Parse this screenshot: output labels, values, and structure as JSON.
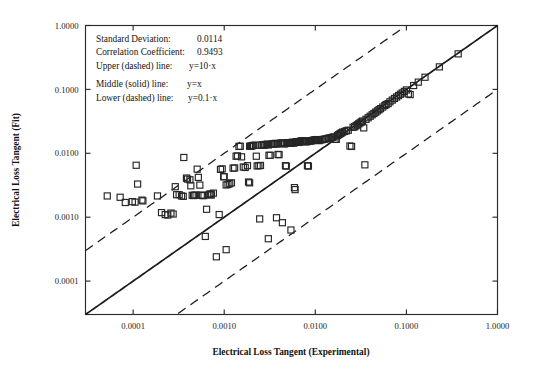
{
  "chart_data": {
    "type": "scatter",
    "title": "",
    "xlabel": "Electrical Loss Tangent (Experimental)",
    "ylabel": "Electrical Loss Tangent (Fit)",
    "xscale": "log",
    "yscale": "log",
    "xlim": [
      3e-05,
      1.0
    ],
    "ylim": [
      3e-05,
      1.0
    ],
    "grid": false,
    "legend": "none",
    "marker": "open-square",
    "xticks": [
      0.0001,
      0.001,
      0.01,
      0.1,
      1.0
    ],
    "xticklabels": [
      "0.0001",
      "0.0010",
      "0.0100",
      "0.1000",
      "1.0000"
    ],
    "yticks": [
      0.0001,
      0.001,
      0.01,
      0.1,
      1.0
    ],
    "yticklabels": [
      "0.0001",
      "0.0010",
      "0.0100",
      "0.1000",
      "1.0000"
    ],
    "annotations": [
      {
        "label": "Standard Deviation:",
        "value": "0.0114"
      },
      {
        "label": "Correlation Coefficient:",
        "value": "0.9493"
      },
      {
        "label": "Upper (dashed) line:",
        "value": "y=10·x"
      },
      {
        "label": "Middle (solid) line:",
        "value": "y=x"
      },
      {
        "label": "Lower (dashed) line:",
        "value": "y=0.1·x"
      }
    ],
    "reference_lines": [
      {
        "name": "upper",
        "style": "dashed",
        "equation": "y=10*x",
        "slope": 1,
        "factor": 10
      },
      {
        "name": "middle",
        "style": "solid",
        "equation": "y=x",
        "slope": 1,
        "factor": 1
      },
      {
        "name": "lower",
        "style": "dashed",
        "equation": "y=0.1*x",
        "slope": 1,
        "factor": 0.1
      }
    ],
    "points": [
      [
        5.2e-05,
        0.00215
      ],
      [
        7.2e-05,
        0.00205
      ],
      [
        8.2e-05,
        0.0017
      ],
      [
        9.8e-05,
        0.00175
      ],
      [
        0.000105,
        0.00172
      ],
      [
        0.000108,
        0.0065
      ],
      [
        0.000112,
        0.0033
      ],
      [
        0.000125,
        0.00185
      ],
      [
        0.000128,
        0.0018
      ],
      [
        0.000185,
        0.00215
      ],
      [
        0.000205,
        0.00118
      ],
      [
        0.000225,
        0.0011
      ],
      [
        0.00024,
        0.00108
      ],
      [
        0.00026,
        0.00116
      ],
      [
        0.000275,
        0.00112
      ],
      [
        0.00029,
        0.003
      ],
      [
        0.0003,
        0.00225
      ],
      [
        0.00032,
        0.00225
      ],
      [
        0.00034,
        0.00215
      ],
      [
        0.000355,
        0.00212
      ],
      [
        0.00036,
        0.0086
      ],
      [
        0.000385,
        0.0041
      ],
      [
        0.000395,
        0.00395
      ],
      [
        0.00042,
        0.00385
      ],
      [
        0.00043,
        0.0031
      ],
      [
        0.000445,
        0.0022
      ],
      [
        0.00046,
        0.00218
      ],
      [
        0.00047,
        0.0022
      ],
      [
        0.00049,
        0.00222
      ],
      [
        0.000505,
        0.00565
      ],
      [
        0.00052,
        0.0042
      ],
      [
        0.00054,
        0.00318
      ],
      [
        0.00056,
        0.00222
      ],
      [
        0.000575,
        0.00218
      ],
      [
        0.0006,
        0.00218
      ],
      [
        0.00062,
        0.0005
      ],
      [
        0.00064,
        0.00133
      ],
      [
        0.00068,
        0.00227
      ],
      [
        0.0007,
        0.0023
      ],
      [
        0.00072,
        0.00222
      ],
      [
        0.00076,
        0.00238
      ],
      [
        0.00082,
        0.00024
      ],
      [
        0.00088,
        0.0011
      ],
      [
        0.00091,
        0.0056
      ],
      [
        0.00095,
        0.0057
      ],
      [
        0.000985,
        0.0043
      ],
      [
        0.001,
        0.0043
      ],
      [
        0.00105,
        0.0032
      ],
      [
        0.0011,
        0.00325
      ],
      [
        0.00115,
        0.00335
      ],
      [
        0.0012,
        0.00345
      ],
      [
        0.00125,
        0.00585
      ],
      [
        0.0013,
        0.0059
      ],
      [
        0.00135,
        0.009
      ],
      [
        0.0014,
        0.0091
      ],
      [
        0.00145,
        0.0128
      ],
      [
        0.0015,
        0.0129
      ],
      [
        0.00155,
        0.0088
      ],
      [
        0.00162,
        0.0061
      ],
      [
        0.0017,
        0.006
      ],
      [
        0.0018,
        0.0064
      ],
      [
        0.00185,
        0.00355
      ],
      [
        0.0019,
        0.00345
      ],
      [
        0.00195,
        0.0129
      ],
      [
        0.002,
        0.013
      ],
      [
        0.00205,
        0.0132
      ],
      [
        0.0021,
        0.0133
      ],
      [
        0.0022,
        0.0134
      ],
      [
        0.00225,
        0.009
      ],
      [
        0.0023,
        0.00635
      ],
      [
        0.0024,
        0.0064
      ],
      [
        0.0025,
        0.00645
      ],
      [
        0.00255,
        0.0134
      ],
      [
        0.0026,
        0.0135
      ],
      [
        0.0027,
        0.0136
      ],
      [
        0.00275,
        0.0134
      ],
      [
        0.0028,
        0.0137
      ],
      [
        0.0029,
        0.0138
      ],
      [
        0.003,
        0.0139
      ],
      [
        0.00305,
        0.0135
      ],
      [
        0.0031,
        0.0093
      ],
      [
        0.0032,
        0.0093
      ],
      [
        0.0033,
        0.0139
      ],
      [
        0.0034,
        0.014
      ],
      [
        0.0035,
        0.0141
      ],
      [
        0.0036,
        0.0142
      ],
      [
        0.0037,
        0.0143
      ],
      [
        0.0038,
        0.0139
      ],
      [
        0.0039,
        0.0096
      ],
      [
        0.004,
        0.0095
      ],
      [
        0.0041,
        0.0143
      ],
      [
        0.0042,
        0.0144
      ],
      [
        0.0043,
        0.0145
      ],
      [
        0.0044,
        0.0144
      ],
      [
        0.0045,
        0.0142
      ],
      [
        0.0046,
        0.014
      ],
      [
        0.0047,
        0.0064
      ],
      [
        0.0048,
        0.0063
      ],
      [
        0.0049,
        0.0145
      ],
      [
        0.005,
        0.0146
      ],
      [
        0.0051,
        0.0147
      ],
      [
        0.0052,
        0.0144
      ],
      [
        0.0053,
        0.0145
      ],
      [
        0.0054,
        0.0146
      ],
      [
        0.0055,
        0.0147
      ],
      [
        0.0056,
        0.0148
      ],
      [
        0.0057,
        0.0149
      ],
      [
        0.0058,
        0.0144
      ],
      [
        0.0059,
        0.0029
      ],
      [
        0.006,
        0.0027
      ],
      [
        0.0061,
        0.015
      ],
      [
        0.0062,
        0.0151
      ],
      [
        0.0063,
        0.0152
      ],
      [
        0.0064,
        0.015
      ],
      [
        0.0065,
        0.0149
      ],
      [
        0.0066,
        0.0148
      ],
      [
        0.0067,
        0.0151
      ],
      [
        0.0068,
        0.0153
      ],
      [
        0.0069,
        0.0154
      ],
      [
        0.007,
        0.0155
      ],
      [
        0.0072,
        0.0156
      ],
      [
        0.0074,
        0.0157
      ],
      [
        0.0076,
        0.0153
      ],
      [
        0.0078,
        0.0152
      ],
      [
        0.008,
        0.0151
      ],
      [
        0.0082,
        0.0064
      ],
      [
        0.0084,
        0.0063
      ],
      [
        0.0086,
        0.0155
      ],
      [
        0.0088,
        0.0156
      ],
      [
        0.009,
        0.0157
      ],
      [
        0.0092,
        0.0158
      ],
      [
        0.0094,
        0.0159
      ],
      [
        0.0096,
        0.016
      ],
      [
        0.0098,
        0.0161
      ],
      [
        0.01,
        0.0162
      ],
      [
        0.0102,
        0.0163
      ],
      [
        0.0104,
        0.0164
      ],
      [
        0.0106,
        0.016
      ],
      [
        0.0108,
        0.0159
      ],
      [
        0.011,
        0.0158
      ],
      [
        0.0115,
        0.0162
      ],
      [
        0.012,
        0.0164
      ],
      [
        0.0125,
        0.0166
      ],
      [
        0.013,
        0.0168
      ],
      [
        0.0135,
        0.017
      ],
      [
        0.014,
        0.0172
      ],
      [
        0.0145,
        0.0174
      ],
      [
        0.015,
        0.0176
      ],
      [
        0.0155,
        0.0178
      ],
      [
        0.016,
        0.018
      ],
      [
        0.0165,
        0.0166
      ],
      [
        0.017,
        0.0165
      ],
      [
        0.0175,
        0.019
      ],
      [
        0.018,
        0.0195
      ],
      [
        0.0185,
        0.02
      ],
      [
        0.019,
        0.0205
      ],
      [
        0.0195,
        0.021
      ],
      [
        0.02,
        0.0215
      ],
      [
        0.021,
        0.022
      ],
      [
        0.022,
        0.0225
      ],
      [
        0.023,
        0.023
      ],
      [
        0.024,
        0.013
      ],
      [
        0.025,
        0.0128
      ],
      [
        0.026,
        0.0255
      ],
      [
        0.027,
        0.026
      ],
      [
        0.028,
        0.027
      ],
      [
        0.029,
        0.028
      ],
      [
        0.03,
        0.029
      ],
      [
        0.031,
        0.03
      ],
      [
        0.032,
        0.031
      ],
      [
        0.033,
        0.032
      ],
      [
        0.034,
        0.025
      ],
      [
        0.035,
        0.0066
      ],
      [
        0.036,
        0.034
      ],
      [
        0.038,
        0.036
      ],
      [
        0.04,
        0.038
      ],
      [
        0.042,
        0.04
      ],
      [
        0.044,
        0.042
      ],
      [
        0.046,
        0.044
      ],
      [
        0.048,
        0.046
      ],
      [
        0.05,
        0.048
      ],
      [
        0.052,
        0.05
      ],
      [
        0.055,
        0.053
      ],
      [
        0.058,
        0.056
      ],
      [
        0.06,
        0.058
      ],
      [
        0.063,
        0.06
      ],
      [
        0.066,
        0.064
      ],
      [
        0.07,
        0.068
      ],
      [
        0.074,
        0.072
      ],
      [
        0.078,
        0.076
      ],
      [
        0.082,
        0.08
      ],
      [
        0.086,
        0.084
      ],
      [
        0.09,
        0.088
      ],
      [
        0.095,
        0.093
      ],
      [
        0.1,
        0.098
      ],
      [
        0.105,
        0.085
      ],
      [
        0.11,
        0.083
      ],
      [
        0.12,
        0.115
      ],
      [
        0.135,
        0.13
      ],
      [
        0.16,
        0.155
      ],
      [
        0.23,
        0.225
      ],
      [
        0.37,
        0.36
      ],
      [
        0.00245,
        0.00094
      ],
      [
        0.00375,
        0.00098
      ],
      [
        0.00435,
        0.00082
      ],
      [
        0.0054,
        0.00063
      ],
      [
        0.00305,
        0.00046
      ],
      [
        0.00105,
        0.00031
      ],
      [
        0.00072,
        0.0023
      ],
      [
        0.0019,
        0.0129
      ]
    ]
  },
  "axis_titles": {
    "x": "Electrical Loss Tangent (Experimental)",
    "y": "Electrical Loss Tangent (Fit)"
  }
}
